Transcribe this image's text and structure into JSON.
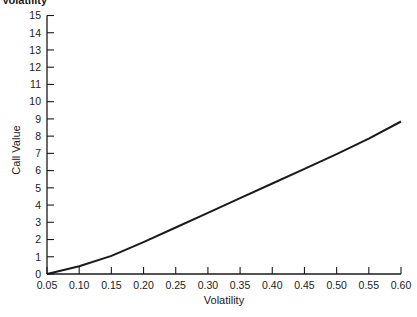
{
  "clipped_title": "Volatility",
  "chart_data": {
    "type": "line",
    "title": "",
    "xlabel": "Volatility",
    "ylabel": "Call Value",
    "x": [
      0.05,
      0.1,
      0.15,
      0.2,
      0.25,
      0.3,
      0.35,
      0.4,
      0.45,
      0.5,
      0.55,
      0.6
    ],
    "series": [
      {
        "name": "Call Value",
        "values": [
          0.0,
          0.45,
          1.05,
          1.85,
          2.7,
          3.55,
          4.4,
          5.25,
          6.1,
          6.95,
          7.85,
          8.85
        ]
      }
    ],
    "xlim": [
      0.05,
      0.6
    ],
    "ylim": [
      0,
      15
    ],
    "x_ticks": [
      "0.05",
      "0.10",
      "0.15",
      "0.20",
      "0.25",
      "0.30",
      "0.35",
      "0.40",
      "0.45",
      "0.50",
      "0.55",
      "0.60"
    ],
    "y_ticks": [
      "0",
      "1",
      "2",
      "3",
      "4",
      "5",
      "6",
      "7",
      "8",
      "9",
      "10",
      "11",
      "12",
      "13",
      "14",
      "15"
    ],
    "grid": false,
    "legend": null,
    "line_color": "#1a1a1a"
  }
}
